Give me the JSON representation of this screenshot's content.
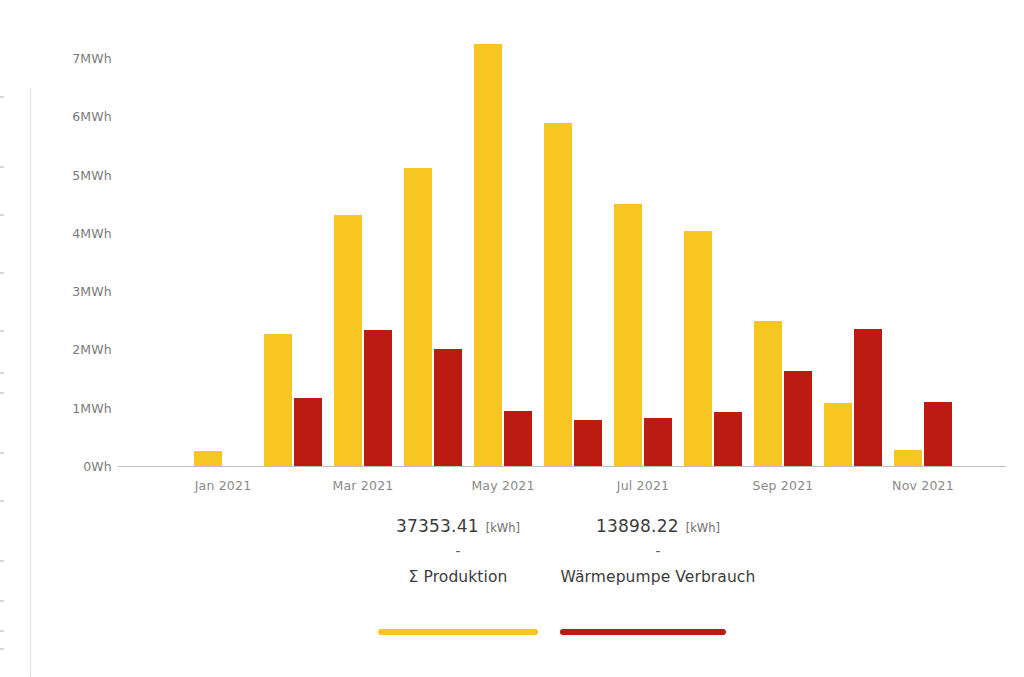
{
  "chart_data": {
    "type": "bar",
    "title": "",
    "xlabel": "",
    "ylabel": "",
    "grid": false,
    "legend_position": "bottom",
    "ylim": [
      0,
      7.6
    ],
    "y_unit": "MWh",
    "y_ticks": [
      "0Wh",
      "1MWh",
      "2MWh",
      "3MWh",
      "4MWh",
      "5MWh",
      "6MWh",
      "7MWh"
    ],
    "y_tick_values": [
      0,
      1,
      2,
      3,
      4,
      5,
      6,
      7
    ],
    "categories": [
      "Jan 2021",
      "Feb 2021",
      "Mar 2021",
      "Apr 2021",
      "May 2021",
      "Jun 2021",
      "Jul 2021",
      "Aug 2021",
      "Sep 2021",
      "Oct 2021",
      "Nov 2021",
      "Dec 2021"
    ],
    "x_tick_labels": [
      "Jan 2021",
      "Mar 2021",
      "May 2021",
      "Jul 2021",
      "Sep 2021",
      "Nov 2021"
    ],
    "x_tick_indices": [
      0,
      2,
      4,
      6,
      8,
      10
    ],
    "series": [
      {
        "name": "Σ Produktion",
        "color": "#F7C622",
        "unit": "MWh",
        "values": [
          0.26,
          2.27,
          4.3,
          5.12,
          7.24,
          5.88,
          4.49,
          4.03,
          2.49,
          1.08,
          0.27,
          0.0
        ]
      },
      {
        "name": "Wärmepumpe Verbrauch",
        "color": "#BC1B12",
        "unit": "MWh",
        "values": [
          0.0,
          1.17,
          2.33,
          2.0,
          0.95,
          0.79,
          0.82,
          0.93,
          1.63,
          2.35,
          1.1,
          0.0
        ]
      }
    ],
    "note": "Series values are plotted per month; the Produktion series bar for the 12th slot and Verbrauch bar for the 1st slot are absent in the rendering."
  },
  "legend": {
    "items": [
      {
        "value": "37353.41",
        "unit": "[kWh]",
        "separator": "-",
        "label": "Σ Produktion",
        "color": "#F7C622"
      },
      {
        "value": "13898.22",
        "unit": "[kWh]",
        "separator": "-",
        "label": "Wärmepumpe Verbrauch",
        "color": "#BC1B12"
      }
    ]
  }
}
